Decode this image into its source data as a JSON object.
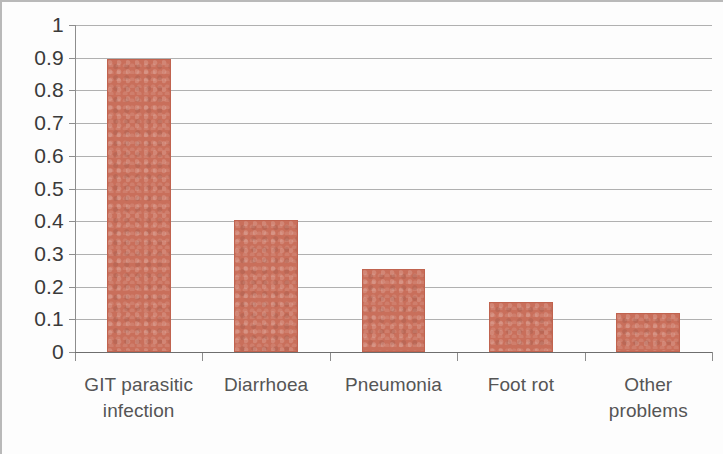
{
  "chart_data": {
    "type": "bar",
    "title": "",
    "subtitle": "",
    "xlabel": "",
    "ylabel": "",
    "categories": [
      "GIT parasitic infection",
      "Diarrhoea",
      "Pneumonia",
      "Foot rot",
      "Other problems"
    ],
    "category_lines": [
      [
        "GIT parasitic",
        "infection"
      ],
      [
        "Diarrhoea"
      ],
      [
        "Pneumonia"
      ],
      [
        "Foot rot"
      ],
      [
        "Other",
        "problems"
      ]
    ],
    "values": [
      0.895,
      0.405,
      0.255,
      0.152,
      0.12
    ],
    "ylim": [
      0,
      1
    ],
    "ytick_labels": [
      "1",
      "0.9",
      "0.8",
      "0.7",
      "0.6",
      "0.5",
      "0.4",
      "0.3",
      "0.2",
      "0.1",
      "0"
    ],
    "ytick_values": [
      1,
      0.9,
      0.8,
      0.7,
      0.6,
      0.5,
      0.4,
      0.3,
      0.2,
      0.1,
      0
    ],
    "grid": true,
    "legend": false,
    "legend_position": "none",
    "series": [
      {
        "name": "Proportion",
        "values": [
          0.895,
          0.405,
          0.255,
          0.152,
          0.12
        ]
      }
    ],
    "colors": {
      "bar_fill": "#c96f5b",
      "bar_border": "#c0634f",
      "gridline": "#9a9a9a",
      "axis": "#6e6e6e",
      "tick_label": "#3a3a3a",
      "category_label": "#555555",
      "background": "#fdfdfd"
    }
  }
}
